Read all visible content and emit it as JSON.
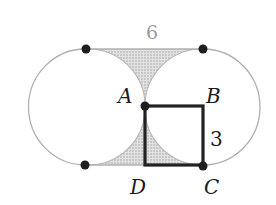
{
  "figure": {
    "labels": {
      "A": "A",
      "B": "B",
      "C": "C",
      "D": "D",
      "top_length": "6",
      "side_length": "3"
    },
    "colors": {
      "circle_stroke": "#b0b0b0",
      "shade_fill": "#d4d4d4",
      "square_stroke": "#222222",
      "dot_fill": "#1e1e1e",
      "top_label": "#9a9a9a"
    }
  }
}
